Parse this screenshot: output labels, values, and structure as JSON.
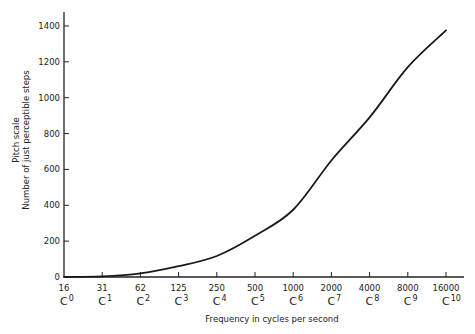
{
  "chart_data": {
    "type": "line",
    "title": "",
    "xlabel": "Frequency in cycles per second",
    "ylabel": [
      "Pitch scale",
      "Number of just perceptible steps"
    ],
    "x_scale": "log2",
    "x": [
      16,
      31,
      62,
      125,
      250,
      500,
      1000,
      2000,
      4000,
      8000,
      16000
    ],
    "x_tick_labels": [
      "16",
      "31",
      "62",
      "125",
      "250",
      "500",
      "1000",
      "2000",
      "4000",
      "8000",
      "16000"
    ],
    "x_note_labels": [
      {
        "note": "C",
        "octave": "0"
      },
      {
        "note": "C",
        "octave": "1"
      },
      {
        "note": "C",
        "octave": "2"
      },
      {
        "note": "C",
        "octave": "3"
      },
      {
        "note": "C",
        "octave": "4"
      },
      {
        "note": "C",
        "octave": "5"
      },
      {
        "note": "C",
        "octave": "6"
      },
      {
        "note": "C",
        "octave": "7"
      },
      {
        "note": "C",
        "octave": "8"
      },
      {
        "note": "C",
        "octave": "9"
      },
      {
        "note": "C",
        "octave": "10"
      }
    ],
    "series": [
      {
        "name": "Pitch scale (just perceptible steps)",
        "values": [
          0,
          3,
          20,
          60,
          117,
          230,
          375,
          650,
          890,
          1170,
          1375
        ]
      }
    ],
    "y_ticks": [
      0,
      200,
      400,
      600,
      800,
      1000,
      1200,
      1400
    ],
    "ylim": [
      0,
      1450
    ],
    "grid": false,
    "legend": "none"
  },
  "caption_partial": "Fig. 1.4 — Pitch scale vs frequency (caption cut off)"
}
